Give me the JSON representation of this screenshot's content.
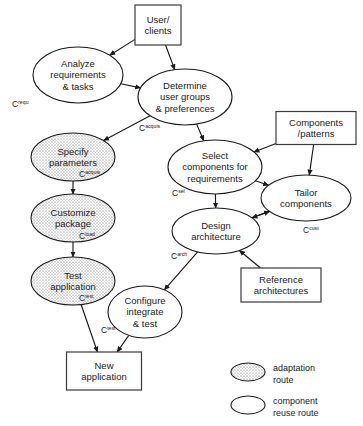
{
  "diagram": {
    "colors": {
      "stroke": "#1a1a1a",
      "box_stroke": "#3a3a3a",
      "shaded_fill": "#d8d8d8",
      "plain_fill": "#ffffff",
      "background": "#ffffff"
    },
    "nodes": [
      {
        "id": "user-clients",
        "shape": "box",
        "lines": [
          "User/",
          "clients"
        ],
        "cx": 158,
        "cy": 25,
        "w": 46,
        "h": 40
      },
      {
        "id": "analyze-requirements",
        "shape": "ellipse-plain",
        "lines": [
          "Analyze",
          "requirements",
          "& tasks"
        ],
        "cx": 78,
        "cy": 75,
        "rx": 45,
        "ry": 28,
        "cost": {
          "base": "C",
          "sup": "requ",
          "x": 12,
          "y": 107
        }
      },
      {
        "id": "determine-user-groups",
        "shape": "ellipse-plain",
        "lines": [
          "Determine",
          "user groups",
          "& preferences"
        ],
        "cx": 185,
        "cy": 97,
        "rx": 47,
        "ry": 28,
        "cost": {
          "base": "C",
          "sup": "acquis",
          "x": 139,
          "y": 131
        }
      },
      {
        "id": "specify-parameters",
        "shape": "ellipse-shaded",
        "lines": [
          "Specify",
          "parameters"
        ],
        "cx": 73,
        "cy": 157,
        "rx": 42,
        "ry": 24,
        "cost": {
          "base": "C",
          "sup": "acquis",
          "x": 79,
          "y": 177
        }
      },
      {
        "id": "customize-package",
        "shape": "ellipse-shaded",
        "lines": [
          "Customize",
          "package"
        ],
        "cx": 73,
        "cy": 218,
        "rx": 42,
        "ry": 24,
        "cost": {
          "base": "C",
          "sup": "load",
          "x": 79,
          "y": 239
        }
      },
      {
        "id": "test-application",
        "shape": "ellipse-shaded",
        "lines": [
          "Test",
          "application"
        ],
        "cx": 73,
        "cy": 281,
        "rx": 42,
        "ry": 24,
        "cost": {
          "base": "C",
          "sup": "test",
          "x": 79,
          "y": 301
        }
      },
      {
        "id": "new-application",
        "shape": "box",
        "lines": [
          "New",
          "application"
        ],
        "cx": 104,
        "cy": 371,
        "w": 75,
        "h": 38
      },
      {
        "id": "components-patterns",
        "shape": "box",
        "lines": [
          "Components",
          "/patterns"
        ],
        "cx": 316,
        "cy": 128,
        "w": 80,
        "h": 33
      },
      {
        "id": "select-components",
        "shape": "ellipse-plain",
        "lines": [
          "Select",
          "components for",
          "requirements"
        ],
        "cx": 215,
        "cy": 167,
        "rx": 47,
        "ry": 27,
        "cost": {
          "base": "C",
          "sup": "sel",
          "x": 172,
          "y": 196
        }
      },
      {
        "id": "tailor-components",
        "shape": "ellipse-plain",
        "lines": [
          "Tailor",
          "components"
        ],
        "cx": 306,
        "cy": 198,
        "rx": 45,
        "ry": 23,
        "cost": {
          "base": "C",
          "sup": "cust",
          "x": 303,
          "y": 233
        }
      },
      {
        "id": "design-architecture",
        "shape": "ellipse-plain",
        "lines": [
          "Design",
          "architecture"
        ],
        "cx": 216,
        "cy": 231,
        "rx": 44,
        "ry": 23,
        "cost": {
          "base": "C",
          "sup": "arch",
          "x": 171,
          "y": 259
        }
      },
      {
        "id": "reference-architectures",
        "shape": "box",
        "lines": [
          "Reference",
          "architectures"
        ],
        "cx": 281,
        "cy": 285,
        "w": 80,
        "h": 34
      },
      {
        "id": "configure-integrate-test",
        "shape": "ellipse-plain",
        "lines": [
          "Configure",
          "integrate",
          "& test"
        ],
        "cx": 145,
        "cy": 312,
        "rx": 37,
        "ry": 26,
        "cost": {
          "base": "C",
          "sup": "test",
          "x": 101,
          "y": 333
        }
      }
    ],
    "edges": [
      {
        "id": "user-to-analyze",
        "from": "user-clients",
        "to": "analyze-requirements"
      },
      {
        "id": "user-to-determine",
        "from": "user-clients",
        "to": "determine-user-groups"
      },
      {
        "id": "analyze-to-determine",
        "from": "analyze-requirements",
        "to": "determine-user-groups"
      },
      {
        "id": "determine-to-specify",
        "from": "determine-user-groups",
        "to": "specify-parameters"
      },
      {
        "id": "determine-to-select",
        "from": "determine-user-groups",
        "to": "select-components"
      },
      {
        "id": "specify-to-customize",
        "from": "specify-parameters",
        "to": "customize-package"
      },
      {
        "id": "customize-to-test",
        "from": "customize-package",
        "to": "test-application"
      },
      {
        "id": "test-to-newapp",
        "from": "test-application",
        "to": "new-application"
      },
      {
        "id": "components-to-select",
        "from": "components-patterns",
        "to": "select-components"
      },
      {
        "id": "components-to-tailor",
        "from": "components-patterns",
        "to": "tailor-components"
      },
      {
        "id": "select-to-tailor",
        "from": "select-components",
        "to": "tailor-components"
      },
      {
        "id": "select-to-design",
        "from": "select-components",
        "to": "design-architecture"
      },
      {
        "id": "design-to-tailor",
        "from": "design-architecture",
        "to": "tailor-components"
      },
      {
        "id": "tailor-to-design",
        "from": "tailor-components",
        "to": "design-architecture"
      },
      {
        "id": "reference-to-design",
        "from": "reference-architectures",
        "to": "design-architecture"
      },
      {
        "id": "design-to-configure",
        "from": "design-architecture",
        "to": "configure-integrate-test"
      },
      {
        "id": "configure-to-newapp",
        "from": "configure-integrate-test",
        "to": "new-application"
      }
    ],
    "legend": {
      "items": [
        {
          "id": "legend-adaptation",
          "style": "shaded",
          "lines": [
            "adaptation",
            "route"
          ]
        },
        {
          "id": "legend-component-reuse",
          "style": "plain",
          "lines": [
            "component",
            "reuse route"
          ]
        }
      ]
    }
  }
}
